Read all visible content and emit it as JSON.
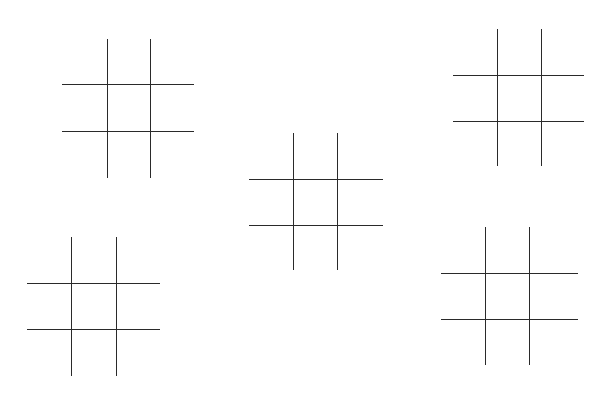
{
  "game": {
    "type": "tic-tac-toe",
    "line_color": "#2a2a2a",
    "background": "#ffffff"
  },
  "boards": [
    {
      "id": "board-1",
      "position": "top-left",
      "vertical_lines": [
        {
          "x": 107,
          "y1": 39,
          "y2": 178
        },
        {
          "x": 150,
          "y1": 39,
          "y2": 178
        }
      ],
      "horizontal_lines": [
        {
          "y": 84,
          "x1": 62,
          "x2": 194
        },
        {
          "y": 131,
          "x1": 62,
          "x2": 194
        }
      ],
      "cells": [
        "",
        "",
        "",
        "",
        "",
        "",
        "",
        "",
        ""
      ]
    },
    {
      "id": "board-2",
      "position": "top-right",
      "vertical_lines": [
        {
          "x": 497,
          "y1": 29,
          "y2": 166
        },
        {
          "x": 541,
          "y1": 29,
          "y2": 166
        }
      ],
      "horizontal_lines": [
        {
          "y": 75,
          "x1": 453,
          "x2": 584
        },
        {
          "y": 121,
          "x1": 453,
          "x2": 584
        }
      ],
      "cells": [
        "",
        "",
        "",
        "",
        "",
        "",
        "",
        "",
        ""
      ]
    },
    {
      "id": "board-3",
      "position": "center",
      "vertical_lines": [
        {
          "x": 293,
          "y1": 133,
          "y2": 270
        },
        {
          "x": 337,
          "y1": 133,
          "y2": 270
        }
      ],
      "horizontal_lines": [
        {
          "y": 179,
          "x1": 249,
          "x2": 383
        },
        {
          "y": 225,
          "x1": 249,
          "x2": 383
        }
      ],
      "cells": [
        "",
        "",
        "",
        "",
        "",
        "",
        "",
        "",
        ""
      ]
    },
    {
      "id": "board-4",
      "position": "bottom-left",
      "vertical_lines": [
        {
          "x": 71,
          "y1": 237,
          "y2": 376
        },
        {
          "x": 116,
          "y1": 237,
          "y2": 376
        }
      ],
      "horizontal_lines": [
        {
          "y": 283,
          "x1": 27,
          "x2": 160
        },
        {
          "y": 329,
          "x1": 27,
          "x2": 160
        }
      ],
      "cells": [
        "",
        "",
        "",
        "",
        "",
        "",
        "",
        "",
        ""
      ]
    },
    {
      "id": "board-5",
      "position": "bottom-right",
      "vertical_lines": [
        {
          "x": 485,
          "y1": 227,
          "y2": 365
        },
        {
          "x": 529,
          "y1": 227,
          "y2": 365
        }
      ],
      "horizontal_lines": [
        {
          "y": 273,
          "x1": 441,
          "x2": 578
        },
        {
          "y": 319,
          "x1": 441,
          "x2": 578
        }
      ],
      "cells": [
        "",
        "",
        "",
        "",
        "",
        "",
        "",
        "",
        ""
      ]
    }
  ]
}
